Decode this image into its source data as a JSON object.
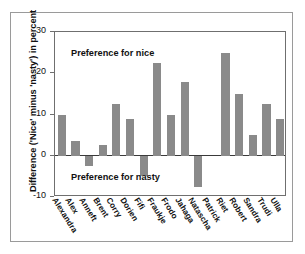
{
  "chart_data": {
    "type": "bar",
    "title": "",
    "subtitle": "",
    "xlabel": "",
    "ylabel": "Difference ('Nice' minus 'nasty') in percent",
    "ylim": [
      -10,
      30
    ],
    "yticks": [
      30,
      20,
      10,
      0,
      -10
    ],
    "ytick_labels": [
      "30",
      "20",
      "10",
      "0",
      "-10"
    ],
    "grid": false,
    "legend": null,
    "categories": [
      "Alexandra",
      "Alex",
      "Anneft",
      "Brent",
      "Corry",
      "Dorien",
      "Fifi",
      "Fraukje",
      "Frodo",
      "Jahaga",
      "Natascha",
      "Patrick",
      "Riet",
      "Robert",
      "Sandra",
      "Trudi",
      "Ulla"
    ],
    "values": [
      10,
      3.5,
      -2.5,
      2.5,
      12.5,
      9,
      -5,
      22.5,
      10,
      18,
      -7.5,
      0,
      25,
      15,
      5,
      12.5,
      9
    ],
    "bar_color": "#8a8a8a",
    "annotations": [
      {
        "text": "Preference for nice",
        "region": "above-zero"
      },
      {
        "text": "Preference for nasty",
        "region": "below-zero"
      }
    ]
  },
  "annotations": {
    "nice": "Preference for nice",
    "nasty": "Preference for nasty"
  }
}
